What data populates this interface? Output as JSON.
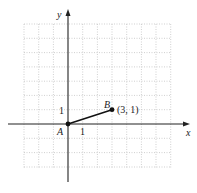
{
  "diagram": {
    "type": "coordinate-plane",
    "x_axis_label": "x",
    "y_axis_label": "y",
    "grid": {
      "x_min": -3,
      "x_max": 7,
      "y_min": -3,
      "y_max": 7
    },
    "tick_labels": {
      "x": "1",
      "y": "1"
    },
    "points": [
      {
        "name": "A",
        "x": 0,
        "y": 0,
        "label": "A"
      },
      {
        "name": "B",
        "x": 3,
        "y": 1,
        "label": "B",
        "coord_label": "(3, 1)"
      }
    ],
    "segments": [
      {
        "from": "A",
        "to": "B"
      }
    ],
    "colors": {
      "grid": "#bbbbbb",
      "axis": "#222222",
      "point": "#111111"
    }
  }
}
